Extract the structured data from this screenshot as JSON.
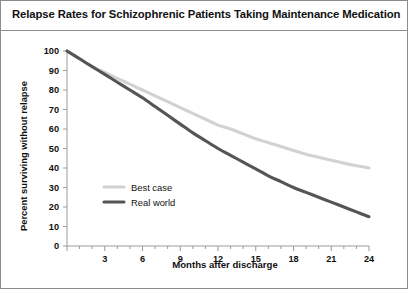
{
  "chart_title": "Relapse Rates for Schizophrenic Patients Taking Maintenance Medication",
  "axis": {
    "x_title": "Months after discharge",
    "y_title": "Percent surviving without relapse"
  },
  "legend": {
    "best_case_label": "Best case",
    "real_world_label": "Real world"
  },
  "colors": {
    "best_case": "#d2d2d2",
    "real_world": "#555555",
    "border": "#8c8c8c",
    "axis": "#9a9a9a",
    "text": "#111111",
    "background": "#ffffff"
  },
  "chart_data": {
    "type": "line",
    "title": "Relapse Rates for Schizophrenic Patients Taking Maintenance Medication",
    "xlabel": "Months after discharge",
    "ylabel": "Percent surviving without relapse",
    "xlim": [
      0,
      24
    ],
    "ylim": [
      0,
      100
    ],
    "xticks": [
      0,
      3,
      6,
      9,
      12,
      15,
      18,
      21,
      24
    ],
    "xtick_labels": [
      "0",
      "3",
      "6",
      "9",
      "12",
      "15",
      "18",
      "21",
      "24"
    ],
    "x_minor_tick_interval": 1,
    "yticks": [
      0,
      10,
      20,
      30,
      40,
      50,
      60,
      70,
      80,
      90,
      100
    ],
    "ytick_labels": [
      "0",
      "10",
      "20",
      "30",
      "40",
      "50",
      "60",
      "70",
      "80",
      "90",
      "100"
    ],
    "grid": false,
    "legend_position": "inside-left",
    "x": [
      0,
      1,
      2,
      3,
      4,
      5,
      6,
      7,
      8,
      9,
      10,
      11,
      12,
      13,
      14,
      15,
      16,
      17,
      18,
      19,
      20,
      21,
      22,
      23,
      24
    ],
    "series": [
      {
        "name": "Best case",
        "color": "#d2d2d2",
        "values": [
          100,
          96,
          92,
          89,
          86,
          83,
          80,
          77,
          74,
          71,
          68,
          65,
          62,
          60,
          57.5,
          55,
          53,
          51,
          49,
          47,
          45.5,
          44,
          42.5,
          41.2,
          40
        ]
      },
      {
        "name": "Real world",
        "color": "#555555",
        "values": [
          100,
          96,
          92,
          88,
          84,
          80,
          76,
          71.5,
          67,
          62.5,
          58,
          54,
          50,
          46.5,
          43,
          39.5,
          36,
          33,
          30,
          27.5,
          25,
          22.5,
          20,
          17.5,
          15
        ]
      }
    ]
  }
}
